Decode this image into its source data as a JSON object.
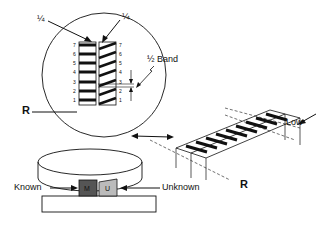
{
  "labels": {
    "quarter_left": "¼",
    "quarter_right": "¼",
    "half_band": "½ Band",
    "reference_top": "R",
    "reference_bottom": "R",
    "low": "Low",
    "known": "Known",
    "unknown": "Unknown",
    "known_block": "M",
    "unknown_block": "U"
  },
  "scale_left": [
    "7",
    "6",
    "5",
    "4",
    "3",
    "2",
    "1"
  ],
  "scale_right": [
    "7",
    "6",
    "5",
    "4",
    "3",
    "2",
    "1"
  ],
  "colors": {
    "ink": "#111111",
    "known_block": "#555555",
    "unknown_block": "#bbbbbb"
  }
}
